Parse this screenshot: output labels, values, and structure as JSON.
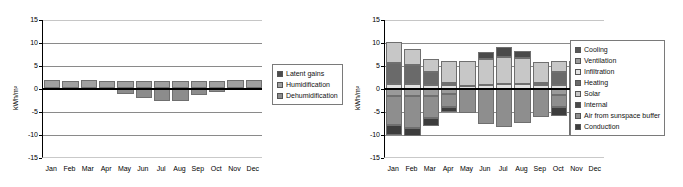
{
  "chart_data": [
    {
      "id": "latent-chart",
      "type": "bar",
      "stacked": true,
      "title": "",
      "xlabel": "",
      "ylabel": "kWh/m²",
      "ylim": [
        -15,
        15
      ],
      "yticks": [
        15,
        10,
        5,
        0,
        -5,
        -10,
        -15
      ],
      "grid": true,
      "legend_position": "right",
      "categories": [
        "Jan",
        "Feb",
        "Mar",
        "Apr",
        "May",
        "Jun",
        "Jul",
        "Aug",
        "Sep",
        "Oct",
        "Nov",
        "Dec"
      ],
      "series": [
        {
          "name": "Latent gains",
          "color": "#4c4c4c",
          "values": [
            0.2,
            0.2,
            0.2,
            0.2,
            0.2,
            0.2,
            0.2,
            0.2,
            0.2,
            0.2,
            0.2,
            0.2
          ]
        },
        {
          "name": "Humidification",
          "color": "#a0a0a0",
          "values": [
            1.8,
            1.6,
            1.7,
            1.6,
            1.5,
            1.5,
            1.5,
            1.5,
            1.5,
            1.6,
            1.7,
            1.8
          ]
        },
        {
          "name": "Dehumidification",
          "color": "#8c8c8c",
          "values": [
            0,
            0,
            0,
            0,
            -1.1,
            -2.0,
            -2.7,
            -2.7,
            -1.4,
            -0.6,
            0,
            0
          ]
        }
      ]
    },
    {
      "id": "energy-balance-chart",
      "type": "bar",
      "stacked": true,
      "title": "",
      "xlabel": "",
      "ylabel": "kWh/m²",
      "ylim": [
        -15,
        15
      ],
      "yticks": [
        15,
        10,
        5,
        0,
        -5,
        -10,
        -15
      ],
      "grid": true,
      "legend_position": "right",
      "categories": [
        "Jan",
        "Feb",
        "Mar",
        "Apr",
        "May",
        "Jun",
        "Jul",
        "Aug",
        "Sep",
        "Oct",
        "Nov",
        "Dec"
      ],
      "series": [
        {
          "name": "Cooling",
          "color": "#585858",
          "values": [
            0,
            0,
            0,
            0,
            0,
            0,
            0,
            0,
            0,
            0,
            0,
            0
          ]
        },
        {
          "name": "Ventilation",
          "color": "#9a9a9a",
          "values": [
            -1.6,
            -1.6,
            -1.5,
            -1.0,
            0,
            0,
            0,
            0,
            0,
            -1.3,
            -1.5,
            -1.8
          ]
        },
        {
          "name": "Infiltration",
          "color": "#e2e2e2",
          "values": [
            1.0,
            1.0,
            0.9,
            0.8,
            0.7,
            0.9,
            1.0,
            1.0,
            0.8,
            0.8,
            0.9,
            1.0
          ]
        },
        {
          "name": "Heating",
          "color": "#6a6a6a",
          "values": [
            4.6,
            4.2,
            2.8,
            0.6,
            0,
            0,
            0,
            0,
            0.4,
            3.0,
            4.4,
            4.7
          ]
        },
        {
          "name": "Solar",
          "color": "#c7c7c7",
          "values": [
            4.6,
            3.4,
            2.8,
            4.6,
            5.4,
            5.7,
            6.0,
            5.8,
            4.7,
            2.3,
            0.8,
            4.5
          ]
        },
        {
          "name": "Internal",
          "color": "#4a4a4a",
          "values": [
            0,
            0,
            0,
            0,
            0,
            1.5,
            2.1,
            1.5,
            0,
            0,
            0,
            0
          ]
        },
        {
          "name": "Air from sunspace buffer",
          "color": "#8e8e8e",
          "values": [
            -6.3,
            -6.9,
            -4.9,
            -3.0,
            -5.2,
            -7.5,
            -8.2,
            -7.4,
            -6.0,
            -2.6,
            -6.3,
            -5.4
          ]
        },
        {
          "name": "Conduction",
          "color": "#3d3d3d",
          "values": [
            -2.2,
            -1.7,
            -1.6,
            -1.0,
            0,
            0,
            0,
            0,
            0,
            -2.0,
            -2.2,
            -2.3
          ]
        }
      ]
    }
  ],
  "left_chart": {
    "ylabel": "kWh/m²",
    "yticks": [
      "15",
      "10",
      "5",
      "0",
      "-5",
      "-10",
      "-15"
    ],
    "xticks": [
      "Jan",
      "Feb",
      "Mar",
      "Apr",
      "May",
      "Jun",
      "Jul",
      "Aug",
      "Sep",
      "Oct",
      "Nov",
      "Dec"
    ],
    "legend": [
      {
        "label": "Latent gains",
        "color": "#4c4c4c"
      },
      {
        "label": "Humidification",
        "color": "#a0a0a0"
      },
      {
        "label": "Dehumidification",
        "color": "#8c8c8c"
      }
    ]
  },
  "right_chart": {
    "ylabel": "kWh/m²",
    "yticks": [
      "15",
      "10",
      "5",
      "0",
      "-5",
      "-10",
      "-15"
    ],
    "xticks": [
      "Jan",
      "Feb",
      "Mar",
      "Apr",
      "May",
      "Jun",
      "Jul",
      "Aug",
      "Sep",
      "Oct",
      "Nov",
      "Dec"
    ],
    "legend": [
      {
        "label": "Cooling",
        "color": "#585858"
      },
      {
        "label": "Ventilation",
        "color": "#9a9a9a"
      },
      {
        "label": "Infiltration",
        "color": "#e2e2e2"
      },
      {
        "label": "Heating",
        "color": "#6a6a6a"
      },
      {
        "label": "Solar",
        "color": "#c7c7c7"
      },
      {
        "label": "Internal",
        "color": "#4a4a4a"
      },
      {
        "label": "Air from sunspace buffer",
        "color": "#8e8e8e"
      },
      {
        "label": "Conduction",
        "color": "#3d3d3d"
      }
    ]
  }
}
